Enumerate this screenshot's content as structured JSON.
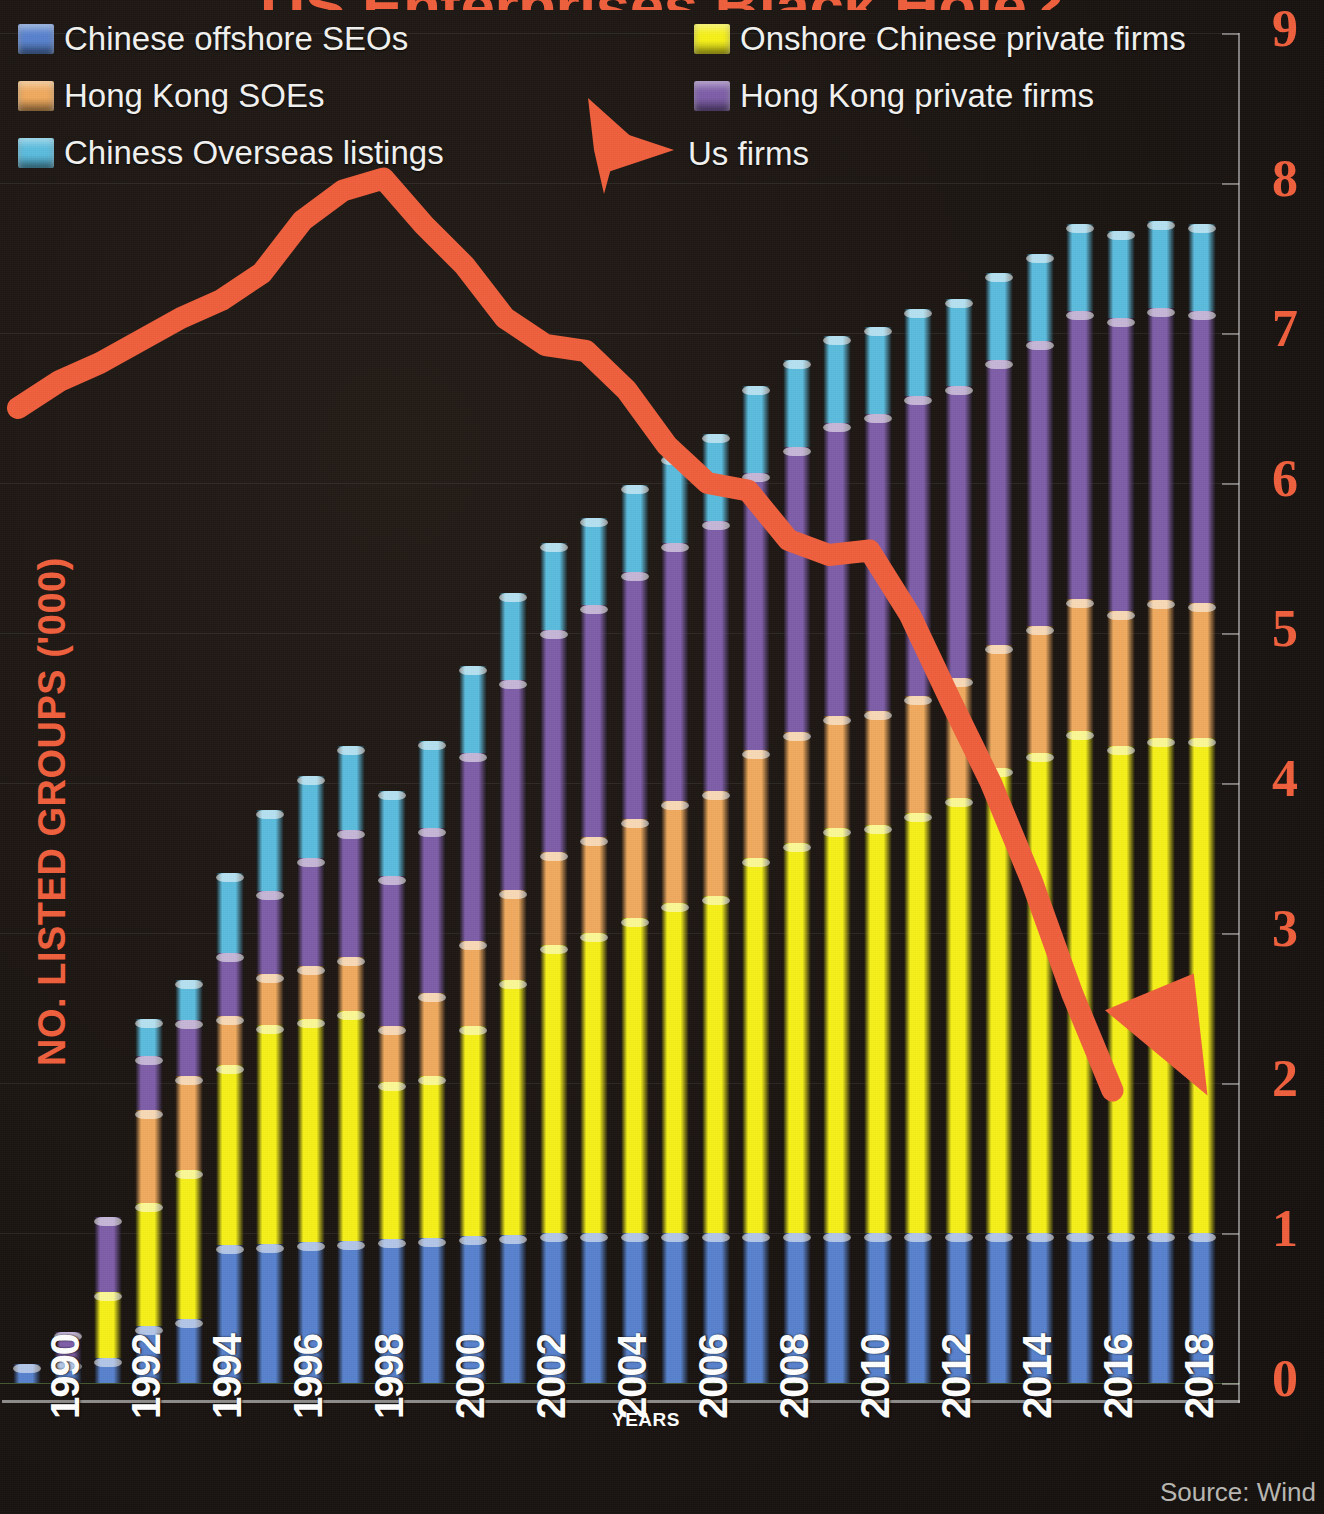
{
  "title": "US Enterprises Black Hole?",
  "source_note": "Source: Wind",
  "axis": {
    "y_title": "NO. LISTED GROUPS ('000)",
    "x_title": "YEARS",
    "y_ticks": [
      "0",
      "1",
      "2",
      "3",
      "4",
      "5",
      "6",
      "7",
      "8",
      "9"
    ],
    "x_ticks": [
      "1990",
      "1992",
      "1994",
      "1996",
      "1998",
      "2000",
      "2002",
      "2004",
      "2006",
      "2008",
      "2010",
      "2012",
      "2014",
      "2016",
      "2018"
    ]
  },
  "legend": {
    "items": [
      {
        "label": "Chinese offshore SEOs",
        "color": "#5882cd",
        "icon": "square-swatch"
      },
      {
        "label": "Onshore Chinese private firms",
        "color": "#f5f018",
        "icon": "square-swatch"
      },
      {
        "label": "Hong Kong SOEs",
        "color": "#efaa5e",
        "icon": "square-swatch"
      },
      {
        "label": "Hong Kong private firms",
        "color": "#7e5ea8",
        "icon": "square-swatch"
      },
      {
        "label": "Chiness Overseas listings",
        "color": "#5bbcde",
        "icon": "square-swatch"
      },
      {
        "label": "Us firms",
        "color": "#ef5f3c",
        "icon": "arrow-right-icon"
      }
    ]
  },
  "colors": {
    "background": "#1a1512",
    "accent": "#ef5f3c",
    "chinese_offshore_seos": "#5882cd",
    "onshore_chinese_private": "#f5f018",
    "hong_kong_soes": "#efaa5e",
    "hong_kong_private": "#7e5ea8",
    "chinese_overseas_listings": "#5bbcde",
    "us_firms_line": "#ef5f3c",
    "tick_text": "#ef5f3c",
    "axis_text": "#ffffff"
  },
  "chart_data": {
    "type": "bar",
    "title": "US Enterprises Black Hole?",
    "subtitle": "",
    "xlabel": "YEARS",
    "ylabel": "NO. LISTED GROUPS ('000)",
    "ylim": [
      0,
      9
    ],
    "grid": true,
    "legend_position": "top",
    "stacked": true,
    "categories": [
      "1990",
      "1991",
      "1992",
      "1993",
      "1994",
      "1995",
      "1996",
      "1997",
      "1998",
      "1999",
      "2000",
      "2001",
      "2002",
      "2003",
      "2004",
      "2005",
      "2006",
      "2007",
      "2008",
      "2009",
      "2010",
      "2011",
      "2012",
      "2013",
      "2014",
      "2015",
      "2016",
      "2017",
      "2018",
      "2019"
    ],
    "series": [
      {
        "name": "Chinese offshore SEOs",
        "color": "#5882cd",
        "values": [
          0.13,
          0.14,
          0.17,
          0.38,
          0.43,
          0.92,
          0.93,
          0.94,
          0.95,
          0.96,
          0.97,
          0.98,
          0.99,
          1.0,
          1.0,
          1.0,
          1.0,
          1.0,
          1.0,
          1.0,
          1.0,
          1.0,
          1.0,
          1.0,
          1.0,
          1.0,
          1.0,
          1.0,
          1.0,
          1.0
        ]
      },
      {
        "name": "Onshore Chinese private firms",
        "color": "#f5f018",
        "values": [
          0.0,
          0.0,
          0.44,
          0.82,
          0.99,
          1.2,
          1.46,
          1.49,
          1.53,
          1.05,
          1.08,
          1.4,
          1.7,
          1.92,
          2.0,
          2.1,
          2.2,
          2.25,
          2.5,
          2.6,
          2.7,
          2.72,
          2.8,
          2.9,
          3.1,
          3.2,
          3.35,
          3.25,
          3.3,
          3.3
        ]
      },
      {
        "name": "Hong Kong SOEs",
        "color": "#efaa5e",
        "values": [
          0.0,
          0.0,
          0.0,
          0.62,
          0.63,
          0.33,
          0.34,
          0.35,
          0.36,
          0.37,
          0.55,
          0.57,
          0.6,
          0.62,
          0.64,
          0.66,
          0.68,
          0.7,
          0.72,
          0.74,
          0.75,
          0.76,
          0.78,
          0.8,
          0.82,
          0.85,
          0.88,
          0.9,
          0.92,
          0.9
        ]
      },
      {
        "name": "Hong Kong private firms",
        "color": "#7e5ea8",
        "values": [
          0.0,
          0.2,
          0.5,
          0.36,
          0.37,
          0.42,
          0.55,
          0.72,
          0.85,
          1.0,
          1.1,
          1.25,
          1.4,
          1.48,
          1.55,
          1.65,
          1.72,
          1.8,
          1.85,
          1.9,
          1.95,
          1.98,
          2.0,
          1.95,
          1.9,
          1.9,
          1.92,
          1.95,
          1.95,
          1.95
        ]
      },
      {
        "name": "Chinese Overseas listings",
        "color": "#5bbcde",
        "values": [
          0.0,
          0.0,
          0.0,
          0.25,
          0.27,
          0.53,
          0.54,
          0.55,
          0.56,
          0.57,
          0.58,
          0.58,
          0.58,
          0.58,
          0.58,
          0.58,
          0.58,
          0.58,
          0.58,
          0.58,
          0.58,
          0.58,
          0.58,
          0.58,
          0.58,
          0.58,
          0.58,
          0.58,
          0.58,
          0.58
        ]
      }
    ],
    "line_series": {
      "name": "Us firms",
      "color": "#ef5f3c",
      "x": [
        "1990",
        "1991",
        "1992",
        "1993",
        "1994",
        "1995",
        "1996",
        "1997",
        "1998",
        "1999",
        "2000",
        "2001",
        "2002",
        "2003",
        "2004",
        "2005",
        "2006",
        "2007",
        "2008",
        "2009",
        "2010",
        "2011",
        "2012",
        "2013",
        "2014",
        "2015",
        "2016",
        "2017"
      ],
      "values": [
        6.5,
        6.68,
        6.8,
        6.95,
        7.1,
        7.22,
        7.4,
        7.75,
        7.95,
        8.03,
        7.72,
        7.45,
        7.1,
        6.92,
        6.88,
        6.62,
        6.25,
        6.0,
        5.95,
        5.62,
        5.52,
        5.55,
        5.12,
        4.55,
        4.0,
        3.35,
        2.6,
        1.95
      ],
      "has_arrowhead": true
    }
  }
}
